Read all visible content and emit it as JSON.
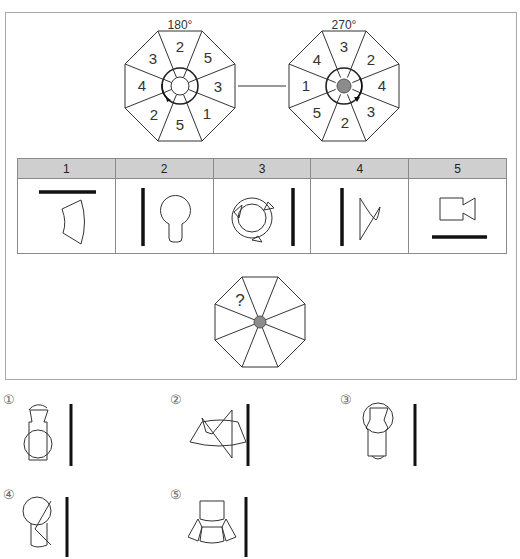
{
  "puzzle": {
    "wheels": [
      {
        "angle_label": "180°",
        "segments_clockwise_from_top": [
          "2",
          "5",
          "3",
          "1",
          "5",
          "2",
          "4",
          "3"
        ],
        "center_fill": "#ffffff",
        "rotation_arrow": "counterclockwise"
      },
      {
        "angle_label": "270°",
        "segments_clockwise_from_top": [
          "3",
          "2",
          "4",
          "3",
          "2",
          "5",
          "1",
          "4"
        ],
        "center_fill": "#8c8c8c",
        "rotation_arrow": "clockwise"
      }
    ],
    "clue_table": {
      "headers": [
        "1",
        "2",
        "3",
        "4",
        "5"
      ],
      "cells": [
        {
          "icon": "arc-segment-icon",
          "bar": "top"
        },
        {
          "icon": "keyhole-icon",
          "bar": "left"
        },
        {
          "icon": "circular-arrows-icon",
          "bar": "right"
        },
        {
          "icon": "cone-icon",
          "bar": "left"
        },
        {
          "icon": "camera-icon",
          "bar": "bottom"
        }
      ]
    },
    "question_wheel": {
      "question_mark": "?",
      "center_fill": "#8c8c8c"
    }
  },
  "options": [
    {
      "label": "①",
      "icon": "option-1-figure-icon"
    },
    {
      "label": "②",
      "icon": "option-2-figure-icon"
    },
    {
      "label": "③",
      "icon": "option-3-figure-icon"
    },
    {
      "label": "④",
      "icon": "option-4-figure-icon"
    },
    {
      "label": "⑤",
      "icon": "option-5-figure-icon"
    }
  ],
  "colors": {
    "frame_border": "#a8a8a8",
    "table_header_bg": "#cfcfcf",
    "line": "#333333",
    "bar": "#111111",
    "center_gray": "#8c8c8c"
  }
}
